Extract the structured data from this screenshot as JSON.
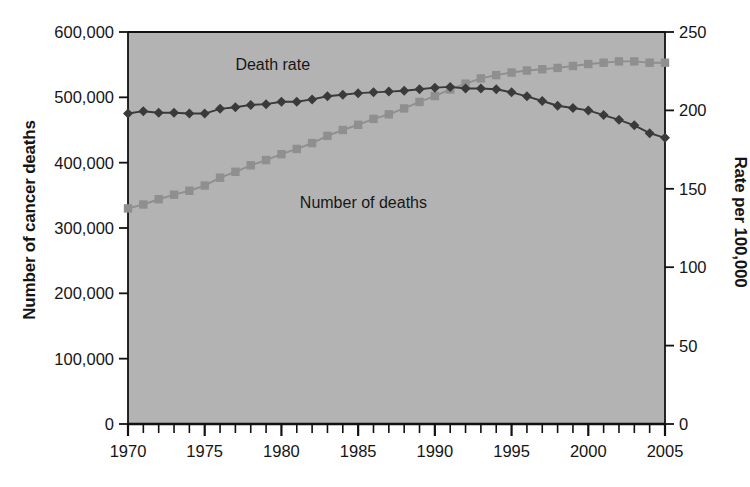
{
  "chart_data": {
    "type": "line",
    "title": "",
    "xlabel": "",
    "ylabel": "Number of cancer deaths",
    "ylabel_right": "Rate per 100,000",
    "plot_background": "#b3b3b3",
    "grid": false,
    "legend_position": "inline-annotations",
    "xlim": [
      1970,
      2005
    ],
    "xticks_major": [
      1970,
      1975,
      1980,
      1985,
      1990,
      1995,
      2000,
      2005
    ],
    "xticklabels": [
      "1970",
      "1975",
      "1980",
      "1985",
      "1990",
      "1995",
      "2000",
      "2005"
    ],
    "xticks_minor_step": 1,
    "ylim": [
      0,
      600000
    ],
    "yticks": [
      0,
      100000,
      200000,
      300000,
      400000,
      500000,
      600000
    ],
    "yticklabels": [
      "0",
      "100,000",
      "200,000",
      "300,000",
      "400,000",
      "500,000",
      "600,000"
    ],
    "ylim_right": [
      0,
      250
    ],
    "yticks_right": [
      0,
      50,
      100,
      150,
      200,
      250
    ],
    "yticklabels_right": [
      "0",
      "50",
      "100",
      "150",
      "200",
      "250"
    ],
    "x": [
      1970,
      1971,
      1972,
      1973,
      1974,
      1975,
      1976,
      1977,
      1978,
      1979,
      1980,
      1981,
      1982,
      1983,
      1984,
      1985,
      1986,
      1987,
      1988,
      1989,
      1990,
      1991,
      1992,
      1993,
      1994,
      1995,
      1996,
      1997,
      1998,
      1999,
      2000,
      2001,
      2002,
      2003,
      2004,
      2005
    ],
    "series": [
      {
        "name": "Number of deaths",
        "axis": "right",
        "units": "deaths",
        "color": "#8f8f8f",
        "marker": "square",
        "label_text": "Number of deaths",
        "values": [
          330000,
          336000,
          344000,
          351000,
          357000,
          365000,
          377000,
          386000,
          396000,
          404000,
          413000,
          421000,
          430000,
          441000,
          450000,
          458000,
          467000,
          474000,
          483000,
          493000,
          502000,
          512000,
          521000,
          529000,
          534000,
          538000,
          541000,
          543000,
          545000,
          548000,
          551000,
          553000,
          555000,
          555000,
          553000,
          553000
        ]
      },
      {
        "name": "Death rate",
        "axis": "right",
        "units": "per 100,000",
        "color": "#3a3a3a",
        "marker": "diamond",
        "label_text": "Death rate",
        "values": [
          198.0,
          199.5,
          198.5,
          198.5,
          198.0,
          198.0,
          201.0,
          202.0,
          203.5,
          204.0,
          205.5,
          205.5,
          207.0,
          209.0,
          210.0,
          211.0,
          211.5,
          212.0,
          212.5,
          213.5,
          214.5,
          215.0,
          214.0,
          214.0,
          213.5,
          211.5,
          209.0,
          206.0,
          203.0,
          201.5,
          200.0,
          197.0,
          194.0,
          190.5,
          185.5,
          182.5
        ]
      }
    ],
    "annotations": [
      {
        "text": "Death rate",
        "x": 1977.0,
        "y_value": 228.0,
        "axis": "right"
      },
      {
        "text": "Number of deaths",
        "x": 1981.2,
        "y_value": 140.0,
        "axis": "right"
      }
    ]
  }
}
